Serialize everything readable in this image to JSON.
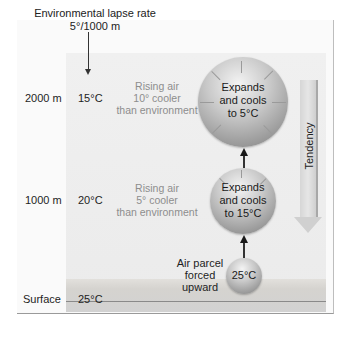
{
  "header": {
    "lapse_title": "Environmental lapse rate",
    "lapse_value": "5°/1000 m"
  },
  "levels": [
    {
      "altitude": "2000 m",
      "env_temp": "15°C",
      "comparison": [
        "Rising air",
        "10° cooler",
        "than environment"
      ],
      "parcel": [
        "Expands",
        "and cools",
        "to 5°C"
      ]
    },
    {
      "altitude": "1000 m",
      "env_temp": "20°C",
      "comparison": [
        "Rising air",
        "5° cooler",
        "than environment"
      ],
      "parcel": [
        "Expands",
        "and cools",
        "to 15°C"
      ]
    },
    {
      "altitude": "Surface",
      "env_temp": "25°C",
      "parcel_label": [
        "Air parcel",
        "forced",
        "upward"
      ],
      "parcel": [
        "25°C"
      ]
    }
  ],
  "tendency_label": "Tendency",
  "colors": {
    "panel": "#eeeeee",
    "surface": "#d4d2ce",
    "sphere_light": "#f4f4f4",
    "sphere_dark": "#7a7a7a",
    "muted_text": "#8d8d8d"
  }
}
